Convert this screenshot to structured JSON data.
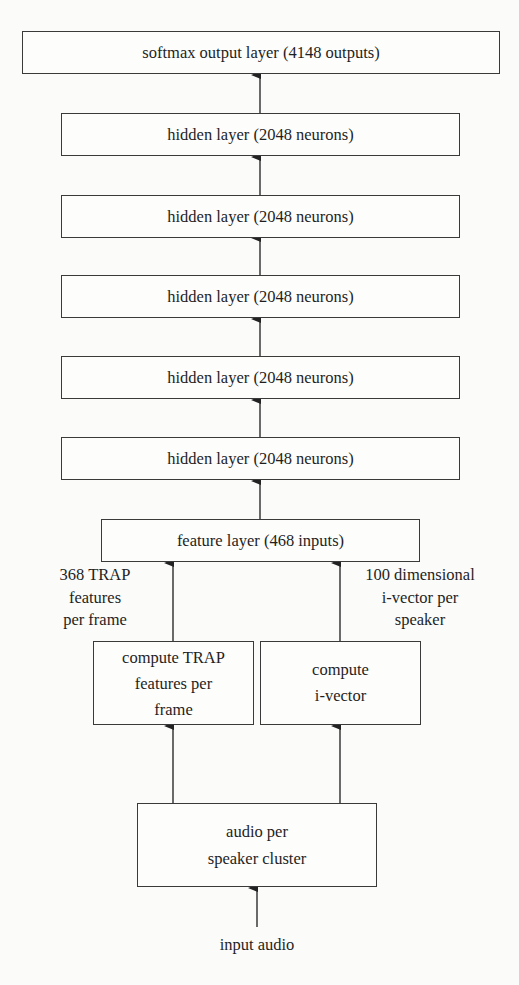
{
  "diagram": {
    "title": "",
    "layers": {
      "output": {
        "label": "softmax output layer (4148 outputs)"
      },
      "hidden": [
        {
          "label": "hidden layer (2048 neurons)"
        },
        {
          "label": "hidden layer (2048 neurons)"
        },
        {
          "label": "hidden layer (2048 neurons)"
        },
        {
          "label": "hidden layer (2048 neurons)"
        },
        {
          "label": "hidden layer (2048 neurons)"
        }
      ],
      "feature": {
        "label": "feature layer (468 inputs)"
      }
    },
    "processing": {
      "trap": {
        "lines": [
          "compute TRAP",
          "features per",
          "frame"
        ]
      },
      "ivector": {
        "lines": [
          "compute",
          "i-vector"
        ]
      },
      "audio": {
        "lines": [
          "audio per",
          "speaker cluster"
        ]
      }
    },
    "edge_labels": {
      "trap_features": {
        "lines": [
          "368 TRAP",
          "features",
          "per frame"
        ]
      },
      "ivector_features": {
        "lines": [
          "100 dimensional",
          "i-vector per",
          "speaker"
        ]
      }
    },
    "input": {
      "label": "input audio"
    },
    "edges": [
      {
        "from": "input audio",
        "to": "audio per speaker cluster"
      },
      {
        "from": "audio per speaker cluster",
        "to": "compute TRAP features per frame"
      },
      {
        "from": "audio per speaker cluster",
        "to": "compute i-vector"
      },
      {
        "from": "compute TRAP features per frame",
        "to": "feature layer (468 inputs)",
        "label": "368 TRAP features per frame"
      },
      {
        "from": "compute i-vector",
        "to": "feature layer (468 inputs)",
        "label": "100 dimensional i-vector per speaker"
      },
      {
        "from": "feature layer (468 inputs)",
        "to": "hidden layer 5"
      },
      {
        "from": "hidden layer 5",
        "to": "hidden layer 4"
      },
      {
        "from": "hidden layer 4",
        "to": "hidden layer 3"
      },
      {
        "from": "hidden layer 3",
        "to": "hidden layer 2"
      },
      {
        "from": "hidden layer 2",
        "to": "hidden layer 1"
      },
      {
        "from": "hidden layer 1",
        "to": "softmax output layer (4148 outputs)"
      }
    ],
    "colors": {
      "line": "#2b2b2b",
      "text": "#1f1f1f",
      "background": "#fbfbfa"
    }
  }
}
